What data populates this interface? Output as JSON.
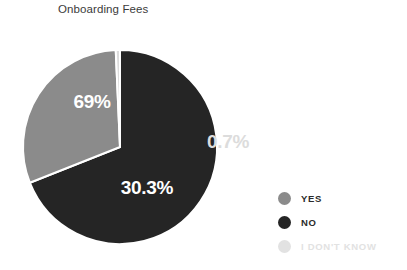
{
  "chart_data": {
    "type": "pie",
    "title": "Onboarding Fees",
    "categories": [
      "NO",
      "YES",
      "I DON'T KNOW"
    ],
    "values": [
      69,
      30.3,
      0.7
    ],
    "value_labels": [
      "69%",
      "30.3%",
      "0.7%"
    ],
    "colors": [
      "#252525",
      "#8b8b8b",
      "#dcdcdc"
    ],
    "unit": "%",
    "start_angle_deg": 0,
    "direction": "clockwise",
    "separator_color": "#ffffff",
    "separator_width_px": 2,
    "legend_position": "right",
    "background": "#ffffff",
    "xlabel": "",
    "ylabel": "",
    "grid": false,
    "slices": [
      {
        "name": "NO",
        "value": 69,
        "label": "69%",
        "color": "#252525",
        "label_color": "#ffffff",
        "label_x": 92,
        "label_y": 108,
        "label_placement": "inside"
      },
      {
        "name": "YES",
        "value": 30.3,
        "label": "30.3%",
        "color": "#8b8b8b",
        "label_color": "#ffffff",
        "label_x": 147,
        "label_y": 194,
        "label_placement": "inside"
      },
      {
        "name": "I DON'T KNOW",
        "value": 0.7,
        "label": "0.7%",
        "color": "#dcdcdc",
        "label_color": "#dcdcdc",
        "label_x": 228,
        "label_y": 148,
        "label_placement": "outside"
      }
    ]
  },
  "title": {
    "text": "Onboarding Fees",
    "color": "#3b3b3b"
  },
  "legend": {
    "items": [
      {
        "label": "YES",
        "color": "#8b8b8b",
        "text_color": "#2b2b2b"
      },
      {
        "label": "NO",
        "color": "#252525",
        "text_color": "#2b2b2b"
      },
      {
        "label": "I DON'T KNOW",
        "color": "#e2e2e2",
        "text_color": "#e2e2e2"
      }
    ]
  },
  "geometry": {
    "center_x": 120,
    "center_y": 147,
    "radius": 97
  }
}
